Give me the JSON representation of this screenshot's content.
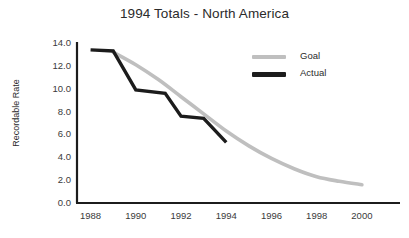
{
  "chart_data": {
    "type": "line",
    "title": "1994 Totals - North America",
    "xlabel": "",
    "ylabel": "Recordable Rate",
    "xlim": [
      1987.4,
      2000.8
    ],
    "ylim": [
      0.0,
      14.0
    ],
    "grid": false,
    "legend_position": "upper-right",
    "x_ticks": [
      "1988",
      "1990",
      "1992",
      "1994",
      "1996",
      "1998",
      "2000"
    ],
    "x_tick_values": [
      1988,
      1990,
      1992,
      1994,
      1996,
      1998,
      2000
    ],
    "y_ticks": [
      "0.0",
      "2.0",
      "4.0",
      "6.0",
      "8.0",
      "10.0",
      "12.0",
      "14.0"
    ],
    "y_tick_values": [
      0.0,
      2.0,
      4.0,
      6.0,
      8.0,
      10.0,
      12.0,
      14.0
    ],
    "series": [
      {
        "name": "Goal",
        "color": "#bfbfbf",
        "x": [
          1989.0,
          1990.0,
          1991.0,
          1992.0,
          1993.0,
          1994.0,
          1995.0,
          1996.0,
          1997.0,
          1998.0,
          1999.0,
          2000.0
        ],
        "values": [
          13.2,
          12.1,
          10.8,
          9.3,
          7.8,
          6.3,
          5.0,
          3.9,
          3.0,
          2.3,
          1.9,
          1.6
        ]
      },
      {
        "name": "Actual",
        "color": "#1c1c1c",
        "x": [
          1988.0,
          1989.0,
          1990.0,
          1991.3,
          1992.0,
          1993.0,
          1994.0
        ],
        "values": [
          13.4,
          13.3,
          9.9,
          9.6,
          7.6,
          7.4,
          5.3
        ]
      }
    ]
  },
  "legend": {
    "goal_label": "Goal",
    "actual_label": "Actual"
  },
  "axis_labels": {
    "y_title": "Recordable Rate"
  }
}
